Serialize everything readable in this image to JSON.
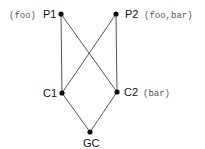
{
  "diagram": {
    "type": "lattice",
    "nodes": [
      {
        "id": "P1",
        "label": "P1",
        "annotation": "(foo)",
        "x": 61,
        "y": 14
      },
      {
        "id": "P2",
        "label": "P2",
        "annotation": "(foo,bar)",
        "x": 116,
        "y": 14
      },
      {
        "id": "C1",
        "label": "C1",
        "annotation": "",
        "x": 62,
        "y": 93
      },
      {
        "id": "C2",
        "label": "C2",
        "annotation": "(bar)",
        "x": 117,
        "y": 92
      },
      {
        "id": "GC",
        "label": "GC",
        "annotation": "",
        "x": 90,
        "y": 132
      }
    ],
    "edges": [
      {
        "from": "P1",
        "to": "C1"
      },
      {
        "from": "P1",
        "to": "C2"
      },
      {
        "from": "P2",
        "to": "C1"
      },
      {
        "from": "P2",
        "to": "C2"
      },
      {
        "from": "C1",
        "to": "GC"
      },
      {
        "from": "C2",
        "to": "GC"
      }
    ]
  },
  "labels": {
    "p1": "P1",
    "p1_ann": "(foo)",
    "p2": "P2",
    "p2_ann": "(foo,bar)",
    "c1": "C1",
    "c2": "C2",
    "c2_ann": "(bar)",
    "gc": "GC"
  }
}
